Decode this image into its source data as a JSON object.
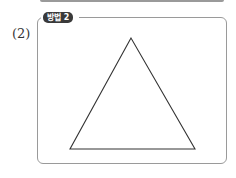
{
  "problem": {
    "number_label": "(2)",
    "method_badge": "방법 2"
  },
  "figure": {
    "shape": "triangle",
    "vertices": [
      [
        131,
        38
      ],
      [
        70,
        149
      ],
      [
        195,
        149
      ]
    ],
    "stroke_color": "#333333"
  },
  "colors": {
    "badge_bg": "#3a3a3a",
    "frame_border": "#9a9a9a"
  }
}
